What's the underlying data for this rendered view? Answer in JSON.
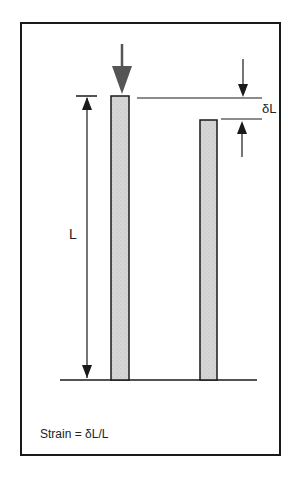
{
  "diagram": {
    "labels": {
      "length": "L",
      "delta_length": "δL",
      "formula": "Strain = δL/L"
    },
    "colors": {
      "line": "#1a1a1a",
      "bar_fill": "#d4d4d4",
      "load_arrow": "#555555",
      "background": "#ffffff"
    },
    "elements": {
      "original_bar": "loaded bar (length L)",
      "compressed_bar": "shortened bar (length L − δL)",
      "load_arrow": "applied compressive load",
      "length_dimension": "L dimension arrow",
      "delta_dimension": "δL dimension arrows"
    }
  }
}
